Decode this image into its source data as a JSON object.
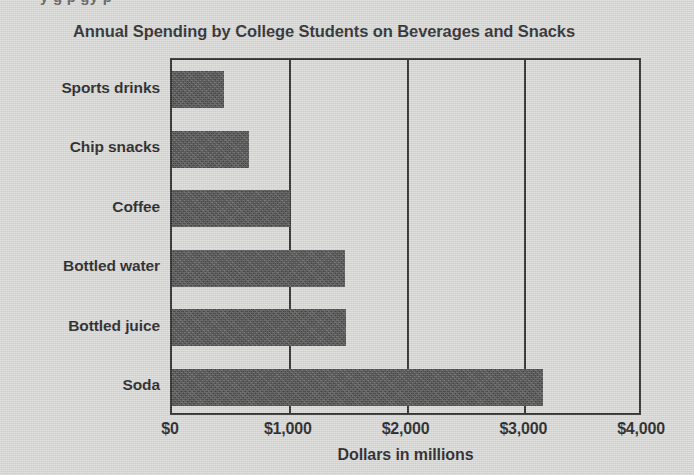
{
  "page": {
    "clipped_text_above": "y                                g       p                        gy      p"
  },
  "chart_data": {
    "type": "bar",
    "orientation": "horizontal",
    "title": "Annual Spending by College Students on Beverages and Snacks",
    "xlabel": "Dollars in millions",
    "ylabel": "",
    "categories": [
      "Sports drinks",
      "Chip snacks",
      "Coffee",
      "Bottled water",
      "Bottled juice",
      "Soda"
    ],
    "values": [
      440,
      650,
      1000,
      1465,
      1480,
      3150
    ],
    "xlim": [
      0,
      4000
    ],
    "xticks": [
      0,
      1000,
      2000,
      3000,
      4000
    ],
    "xtick_labels": [
      "$0",
      "$1,000",
      "$2,000",
      "$3,000",
      "$4,000"
    ],
    "grid": true,
    "grid_axis": "x",
    "legend": false,
    "bar_color": "#3a3a3a",
    "axis_color": "#1c1c1c",
    "background_color": "#d9d9d7"
  }
}
